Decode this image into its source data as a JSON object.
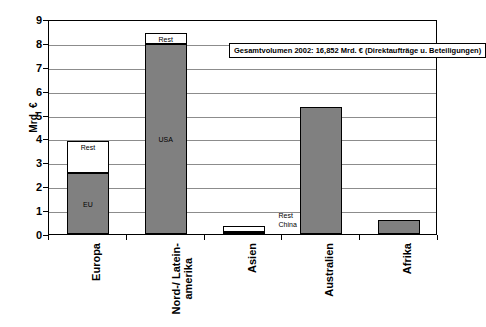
{
  "chart_data": {
    "type": "bar",
    "title": "Gesamtvolumen 2002: 16,852 Mrd. € (Direktaufträge u. Beteiligungen)",
    "subtitle": "",
    "xlabel": "",
    "ylabel": "Mrd. €",
    "ylim": [
      0,
      9
    ],
    "ytick_labels": [
      "0",
      "1",
      "2",
      "3",
      "4",
      "5",
      "6",
      "7",
      "8",
      "9"
    ],
    "ytick_values": [
      0,
      1,
      2,
      3,
      4,
      5,
      6,
      7,
      8,
      9
    ],
    "grid": true,
    "legend": "none",
    "stacked": true,
    "categories": [
      "Europa",
      "Nord-/ Latein-\namerika",
      "Asien",
      "Australien",
      "Afrika"
    ],
    "series": [
      {
        "name": "Hauptanteil",
        "values": [
          2.55,
          7.95,
          0.08,
          5.3,
          0.6
        ],
        "segment_labels": [
          "EU",
          "USA",
          "China",
          "",
          ""
        ],
        "color": "#808080"
      },
      {
        "name": "Rest",
        "values": [
          1.35,
          0.45,
          0.27,
          0.0,
          0.0
        ],
        "segment_labels": [
          "Rest",
          "Rest",
          "Rest",
          "",
          ""
        ],
        "color": "#ffffff"
      }
    ],
    "totals": [
      3.9,
      8.4,
      0.35,
      5.3,
      0.6
    ],
    "annotations": [
      {
        "text": "Rest",
        "category": "Asien",
        "placement": "right-outside"
      },
      {
        "text": "China",
        "category": "Asien",
        "placement": "right-outside"
      }
    ]
  },
  "axis": {
    "y_title": "Mrd. €"
  },
  "colors": {
    "bar_primary": "#808080",
    "bar_secondary": "#ffffff",
    "bar_dark": "#4d4d4d",
    "axis": "#000000",
    "grid": "#8c8c8c",
    "background": "#ffffff"
  }
}
